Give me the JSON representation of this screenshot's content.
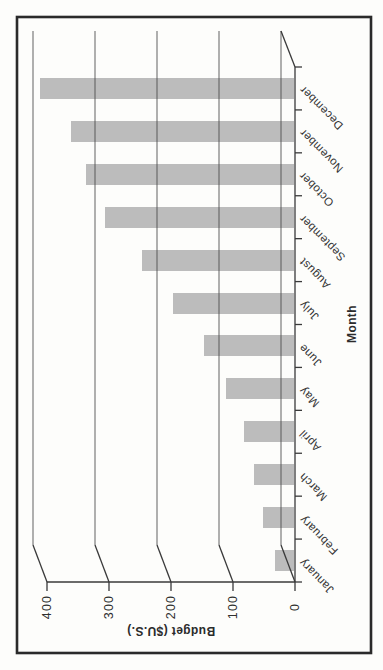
{
  "chart_data": {
    "type": "bar",
    "orientation": "column chart rotated 90 degrees counter-clockwise on the page (sideways landscape figure)",
    "style": "scanned grayscale print, 3-D perspective with offset back wall gridlines",
    "title": "",
    "xlabel": "Month",
    "ylabel": "Budget ($U.S.)",
    "categories": [
      "January",
      "February",
      "March",
      "April",
      "May",
      "June",
      "July",
      "August",
      "September",
      "October",
      "November",
      "December"
    ],
    "values": [
      30,
      50,
      65,
      80,
      110,
      145,
      195,
      245,
      305,
      335,
      360,
      410
    ],
    "value_axis": {
      "ticks": [
        "0",
        "100",
        "200",
        "300",
        "400"
      ],
      "range": [
        0,
        400
      ]
    },
    "page_order_top_to_bottom": "December down to January",
    "grid": true,
    "legend": false,
    "colors": {
      "bar": "#bcbcbc",
      "grid_line": "#4b4b4b",
      "axis_line": "#3a3a3a",
      "text": "#2f2f2f",
      "frame": "#2a2a2a",
      "background": "#fdfdfb"
    }
  }
}
